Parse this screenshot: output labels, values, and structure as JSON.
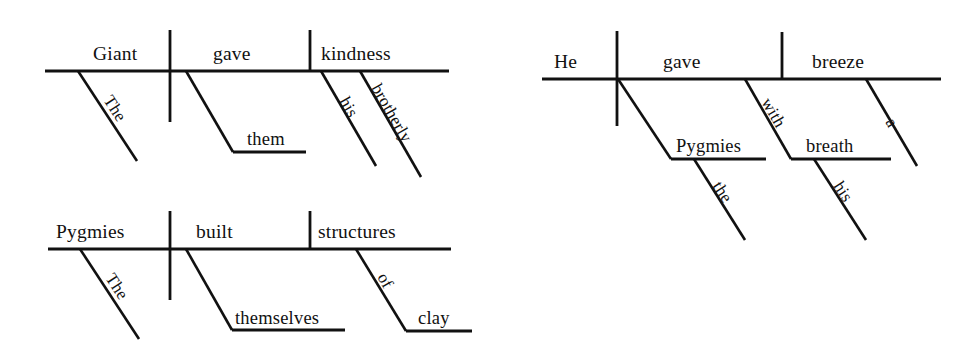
{
  "page": {
    "background_color": "#ffffff",
    "ink_color": "#111111"
  },
  "diagrams": [
    {
      "id": "diagram-1",
      "sentence": "The Giant gave them his brotherly kindness.",
      "subject": "Giant",
      "verb": "gave",
      "direct_object": "kindness",
      "indirect_object": "them",
      "words": {
        "subject": "Giant",
        "verb": "gave",
        "object": "kindness",
        "subject_modifier": "The",
        "indirect_object": "them",
        "object_modifier_1": "his",
        "object_modifier_2": "brotherly"
      }
    },
    {
      "id": "diagram-2",
      "sentence": "The Pygmies built themselves structures of clay.",
      "subject": "Pygmies",
      "verb": "built",
      "direct_object": "structures",
      "indirect_object": "themselves",
      "words": {
        "subject": "Pygmies",
        "verb": "built",
        "object": "structures",
        "subject_modifier": "The",
        "indirect_object": "themselves",
        "preposition": "of",
        "prep_object": "clay"
      }
    },
    {
      "id": "diagram-3",
      "sentence": "He gave the Pygmies a breeze with his breath.",
      "subject": "He",
      "verb": "gave",
      "direct_object": "breeze",
      "indirect_object": "Pygmies",
      "words": {
        "subject": "He",
        "verb": "gave",
        "object": "breeze",
        "indirect_object": "Pygmies",
        "indirect_object_modifier": "the",
        "object_modifier": "a",
        "preposition": "with",
        "prep_object": "breath",
        "prep_object_modifier": "his"
      }
    }
  ]
}
